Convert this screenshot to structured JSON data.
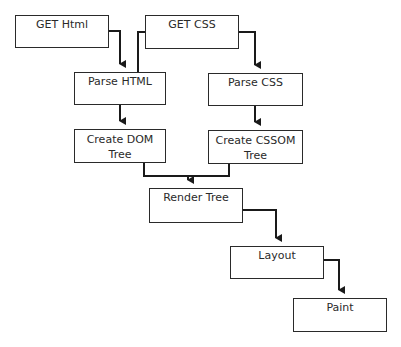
{
  "diagram": {
    "type": "flowchart",
    "title": "",
    "nodes": [
      {
        "id": "get_html",
        "label": "GET Html"
      },
      {
        "id": "get_css",
        "label": "GET CSS"
      },
      {
        "id": "parse_html",
        "label": "Parse HTML"
      },
      {
        "id": "parse_css",
        "label": "Parse CSS"
      },
      {
        "id": "create_dom",
        "label_line1": "Create DOM",
        "label_line2": "Tree"
      },
      {
        "id": "create_cssom",
        "label_line1": "Create CSSOM",
        "label_line2": "Tree"
      },
      {
        "id": "render_tree",
        "label": "Render Tree"
      },
      {
        "id": "layout",
        "label": "Layout"
      },
      {
        "id": "paint",
        "label": "Paint"
      }
    ],
    "edges": [
      {
        "from": "get_html",
        "to": "parse_html"
      },
      {
        "from": "get_css",
        "to": "parse_html"
      },
      {
        "from": "get_css",
        "to": "parse_css"
      },
      {
        "from": "parse_html",
        "to": "create_dom"
      },
      {
        "from": "parse_css",
        "to": "create_cssom"
      },
      {
        "from": "create_dom",
        "to": "render_tree"
      },
      {
        "from": "create_cssom",
        "to": "render_tree"
      },
      {
        "from": "render_tree",
        "to": "layout"
      },
      {
        "from": "layout",
        "to": "paint"
      }
    ],
    "colors": {
      "stroke": "#2a2a2a",
      "background": "#ffffff"
    }
  }
}
